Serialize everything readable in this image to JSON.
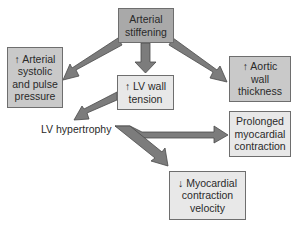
{
  "diagram": {
    "type": "flowchart",
    "colors": {
      "arrow_fill": "#7c7c7c",
      "arrow_stroke": "#4a4a4a",
      "box_dark": "#a9a9a9",
      "box_mid": "#c9c9c9",
      "box_light": "#e8e8e8",
      "text": "#2a2a2a"
    },
    "nodes": {
      "arterial_stiffening": {
        "label": "Arterial\nstiffening"
      },
      "arterial_pressure": {
        "label": "↑ Arterial\nsystolic\nand pulse\npressure"
      },
      "lv_wall_tension": {
        "label": "↑ LV wall\ntension"
      },
      "aortic_wall": {
        "label": "↑ Aortic\nwall\nthickness"
      },
      "lv_hypertrophy": {
        "label": "LV hypertrophy"
      },
      "prolonged_contraction": {
        "label": "Prolonged\nmyocardial\ncontraction"
      },
      "contraction_velocity": {
        "label": "↓ Myocardial\ncontraction\nvelocity"
      }
    },
    "edges": [
      {
        "from": "Arterial stiffening",
        "to": "↑ Arterial systolic and pulse pressure"
      },
      {
        "from": "Arterial stiffening",
        "to": "↑ LV wall tension"
      },
      {
        "from": "Arterial stiffening",
        "to": "↑ Aortic wall thickness"
      },
      {
        "from": "↑ LV wall tension",
        "to": "LV hypertrophy"
      },
      {
        "from": "LV hypertrophy",
        "to": "Prolonged myocardial contraction"
      },
      {
        "from": "LV hypertrophy",
        "to": "↓ Myocardial contraction velocity"
      }
    ]
  }
}
